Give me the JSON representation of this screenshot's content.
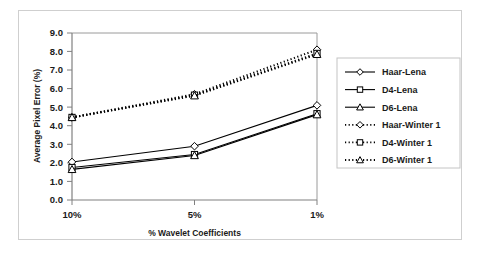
{
  "chart_data": {
    "type": "line",
    "title": "",
    "xlabel": "% Wavelet Coefficients",
    "ylabel": "Average Pixel Error (%)",
    "categories": [
      "10%",
      "5%",
      "1%"
    ],
    "ylim": [
      0.0,
      9.0
    ],
    "ytick_step": 1.0,
    "ytick_labels": [
      "0.0",
      "1.0",
      "2.0",
      "3.0",
      "4.0",
      "5.0",
      "6.0",
      "7.0",
      "8.0",
      "9.0"
    ],
    "grid": false,
    "legend_position": "right",
    "series": [
      {
        "name": "Haar-Lena",
        "values": [
          2.05,
          2.9,
          5.1
        ],
        "style": "solid",
        "marker": "diamond"
      },
      {
        "name": "D4-Lena",
        "values": [
          1.75,
          2.45,
          4.65
        ],
        "style": "solid",
        "marker": "square"
      },
      {
        "name": "D6-Lena",
        "values": [
          1.65,
          2.4,
          4.6
        ],
        "style": "solid",
        "marker": "triangle"
      },
      {
        "name": "Haar-Winter 1",
        "values": [
          4.45,
          5.7,
          8.1
        ],
        "style": "dotted",
        "marker": "diamond"
      },
      {
        "name": "D4-Winter 1",
        "values": [
          4.45,
          5.65,
          7.9
        ],
        "style": "dotted",
        "marker": "square"
      },
      {
        "name": "D6-Winter 1",
        "values": [
          4.45,
          5.62,
          7.85
        ],
        "style": "dotted",
        "marker": "triangle"
      }
    ],
    "colors": {
      "line": "#000000",
      "axis": "#808080",
      "frame": "#cfcfcf",
      "background": "#ffffff"
    }
  },
  "legend": {
    "entries": [
      {
        "label": "Haar-Lena"
      },
      {
        "label": "D4-Lena"
      },
      {
        "label": "D6-Lena"
      },
      {
        "label": "Haar-Winter 1"
      },
      {
        "label": "D4-Winter 1"
      },
      {
        "label": "D6-Winter 1"
      }
    ]
  }
}
